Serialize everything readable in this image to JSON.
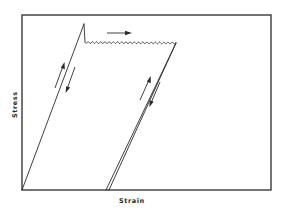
{
  "figure": {
    "type": "stress-strain-diagram",
    "axes": {
      "xlabel": "Strain",
      "ylabel": "Stress"
    },
    "segments": [
      {
        "name": "initial-elastic-loading",
        "from": "origin",
        "to": "upper-yield-point"
      },
      {
        "name": "yield-drop",
        "from": "upper-yield-point",
        "to": "lower-yield-point"
      },
      {
        "name": "serrated-plastic-flow",
        "from": "lower-yield-point",
        "to": "unloading-point",
        "style": "wavy"
      },
      {
        "name": "elastic-unloading",
        "from": "unloading-point",
        "to": "permanent-set-point"
      },
      {
        "name": "elastic-reloading",
        "from": "permanent-set-point",
        "to": "unloading-point"
      }
    ],
    "arrows": [
      {
        "name": "plastic-flow-direction",
        "direction": "right"
      },
      {
        "name": "initial-loading-up",
        "direction": "up"
      },
      {
        "name": "initial-unloading-down",
        "direction": "down"
      },
      {
        "name": "reloading-up",
        "direction": "up"
      },
      {
        "name": "unloading-down",
        "direction": "down"
      }
    ]
  }
}
